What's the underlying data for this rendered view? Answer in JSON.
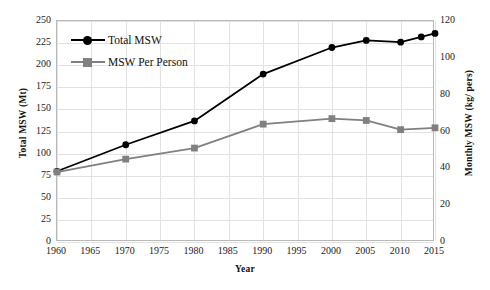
{
  "chart_data": {
    "type": "line",
    "title": "",
    "xlabel": "Year",
    "ylabel": "Total MSW (Mt)",
    "ylabel_right": "Monthly MSW (kg/ pers)",
    "grid": true,
    "legend_position": "top-left",
    "xlim": [
      1960,
      2015
    ],
    "xticks": [
      1960,
      1965,
      1970,
      1975,
      1980,
      1985,
      1990,
      1995,
      2000,
      2005,
      2010,
      2015
    ],
    "ylim_left": [
      0,
      250
    ],
    "yticks_left": [
      0,
      25,
      50,
      75,
      100,
      125,
      150,
      175,
      200,
      225,
      250
    ],
    "ylim_right": [
      0,
      120
    ],
    "yticks_right": [
      0,
      20,
      40,
      60,
      80,
      100,
      120
    ],
    "series": [
      {
        "name": "Total MSW",
        "axis": "left",
        "color": "#000000",
        "marker": "circle",
        "x": [
          1960,
          1970,
          1980,
          1990,
          2000,
          2005,
          2010,
          2013,
          2015
        ],
        "values": [
          80,
          110,
          137,
          190,
          220,
          228,
          226,
          232,
          236
        ]
      },
      {
        "name": "MSW Per Person",
        "axis": "right",
        "color": "#808080",
        "marker": "square",
        "x": [
          1960,
          1970,
          1980,
          1990,
          2000,
          2005,
          2010,
          2015
        ],
        "values": [
          38,
          45,
          51,
          64,
          67,
          66,
          61,
          62
        ]
      }
    ]
  },
  "legend": {
    "items": [
      {
        "label": "Total MSW"
      },
      {
        "label": "MSW Per  Person"
      }
    ]
  }
}
